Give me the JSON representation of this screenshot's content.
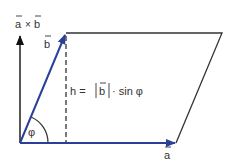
{
  "diagram": {
    "labels": {
      "cross_product": "a × b",
      "cross_a": "a",
      "cross_times": "×",
      "cross_b": "b",
      "vector_b": "b",
      "vector_a": "a",
      "height_formula": "h = |b| · sin φ",
      "h_prefix": "h =",
      "abs_b": "b",
      "sin_part": "· sin φ",
      "angle": "φ"
    },
    "colors": {
      "vector": "#2a3f98",
      "outline": "#333333",
      "cross_arrow": "#111111",
      "text": "#333333"
    },
    "points": {
      "origin": [
        20,
        143
      ],
      "a_tip": [
        176,
        143
      ],
      "b_tip": [
        66,
        33
      ],
      "far_corner": [
        222,
        33
      ],
      "cross_tip": [
        20,
        35
      ]
    }
  }
}
